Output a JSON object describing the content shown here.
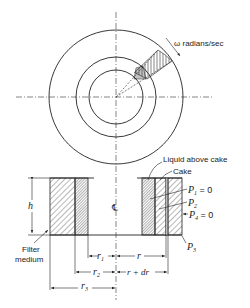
{
  "figure": {
    "type": "centrifugal filter schematic",
    "top_view": {
      "rotation_label": "ω radians/sec",
      "circles": [
        "outer wall (r3)",
        "cake surface (r2)",
        "liquid surface (r1)"
      ]
    },
    "section_view": {
      "height_label": "h",
      "centerline_label": "℄",
      "callouts": {
        "liquid": "Liquid above cake",
        "cake": "Cake",
        "filter_medium": [
          "Filter",
          "medium"
        ]
      },
      "pressures": {
        "p1": {
          "sym": "P",
          "sub": "1",
          "val": " = 0"
        },
        "p2": {
          "sym": "P",
          "sub": "2",
          "val": ""
        },
        "p3": {
          "sym": "P",
          "sub": "3",
          "val": ""
        },
        "p4": {
          "sym": "P",
          "sub": "4",
          "val": " = 0"
        }
      },
      "dimensions": {
        "r1": {
          "sym": "r",
          "sub": "1"
        },
        "r": {
          "sym": "r"
        },
        "r2": {
          "sym": "r",
          "sub": "2"
        },
        "rdr": {
          "sym": "r + dr"
        },
        "r3": {
          "sym": "r",
          "sub": "3"
        }
      }
    }
  }
}
